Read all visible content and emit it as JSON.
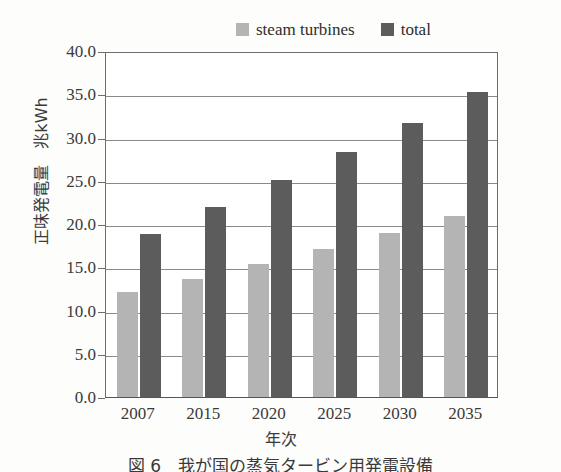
{
  "chart_data": {
    "type": "bar",
    "title": "",
    "categories": [
      "2007",
      "2015",
      "2020",
      "2025",
      "2030",
      "2035"
    ],
    "series": [
      {
        "name": "steam turbines",
        "color": "#b4b4b4",
        "values": [
          12.1,
          13.6,
          15.4,
          17.1,
          19.0,
          20.9
        ]
      },
      {
        "name": "total",
        "color": "#5c5c5c",
        "values": [
          18.8,
          22.0,
          25.1,
          28.3,
          31.7,
          35.3
        ]
      }
    ],
    "xlabel": "年次",
    "ylabel": "正味発電量　兆kWh",
    "ylim": [
      0,
      40
    ],
    "ytick_labels": [
      "0.0",
      "5.0",
      "10.0",
      "15.0",
      "20.0",
      "25.0",
      "30.0",
      "35.0",
      "40.0"
    ],
    "ytick_values": [
      0,
      5,
      10,
      15,
      20,
      25,
      30,
      35,
      40
    ],
    "ytick_step": 5,
    "grid": "horizontal",
    "legend_position": "top-right",
    "bar_unit": "兆kWh"
  },
  "legend": {
    "entries": [
      {
        "label": "steam turbines",
        "swatch": "light-gray-swatch"
      },
      {
        "label": "total",
        "swatch": "dark-gray-swatch"
      }
    ]
  },
  "caption": {
    "text": "図 6　我が国の蒸気タービン用発電設備"
  },
  "colors": {
    "steam_turbines": "#b4b4b4",
    "total": "#5c5c5c",
    "axis": "#6d6d6d",
    "grid": "#8a8a8a",
    "page_background": "#fdfdfb"
  }
}
